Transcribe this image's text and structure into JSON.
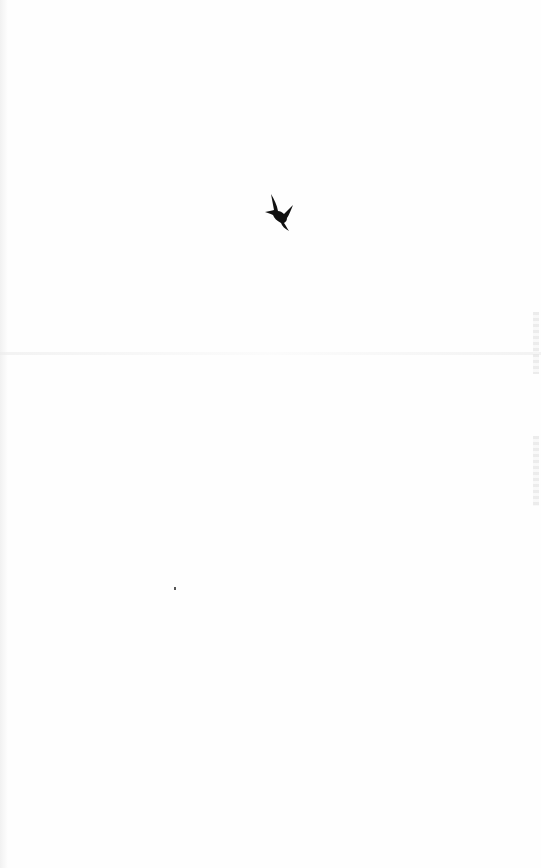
{
  "page": {
    "background": "#fefefe",
    "content_text": "",
    "ornament": {
      "icon": "bird-in-flight-icon",
      "color": "#111111"
    },
    "watermark": {
      "position": "right-edge",
      "color": "#e4e4e4"
    }
  }
}
